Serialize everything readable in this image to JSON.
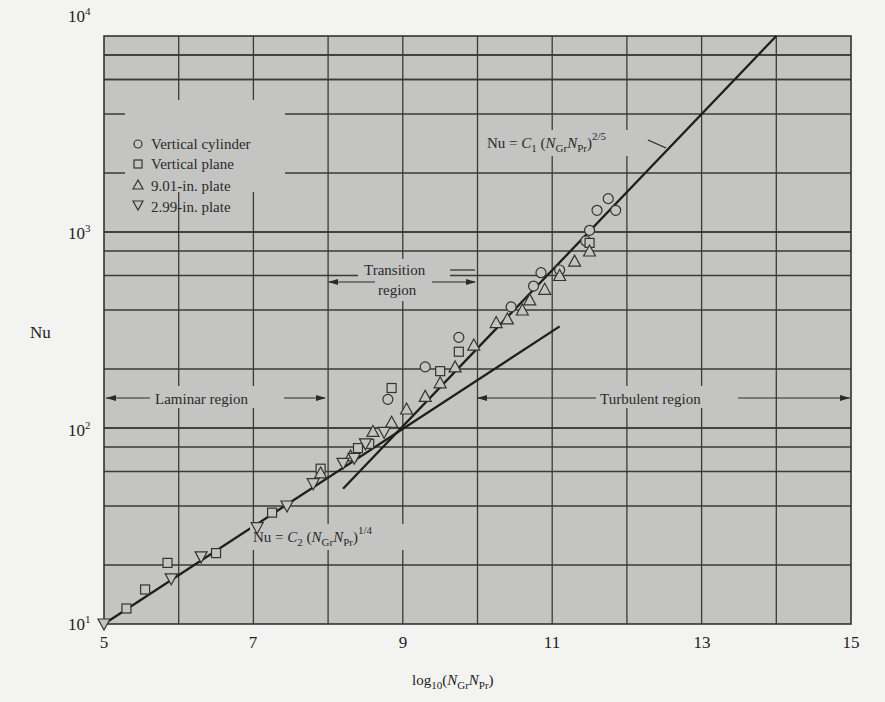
{
  "chart_data": {
    "type": "scatter",
    "title": "",
    "xlabel": "log10(N_Gr N_Pr)",
    "ylabel": "Nu",
    "xlim": [
      5,
      15
    ],
    "ylim": [
      10,
      10000
    ],
    "yscale": "log",
    "grid": true,
    "x_ticks": [
      "5",
      "7",
      "9",
      "11",
      "13",
      "15"
    ],
    "y_ticks": [
      "10^1",
      "10^2",
      "10^3",
      "10^4"
    ],
    "legend_position": "upper-left",
    "series": [
      {
        "name": "Vertical cylinder",
        "marker": "circle",
        "points": [
          [
            8.8,
            140
          ],
          [
            9.3,
            205
          ],
          [
            9.75,
            290
          ],
          [
            10.45,
            415
          ],
          [
            10.75,
            530
          ],
          [
            10.85,
            620
          ],
          [
            11.1,
            640
          ],
          [
            11.45,
            900
          ],
          [
            11.5,
            1020
          ],
          [
            11.6,
            1290
          ],
          [
            11.75,
            1480
          ],
          [
            11.85,
            1290
          ]
        ]
      },
      {
        "name": "Vertical plane",
        "marker": "square",
        "points": [
          [
            5.3,
            12
          ],
          [
            5.55,
            15
          ],
          [
            5.85,
            20.5
          ],
          [
            6.5,
            23
          ],
          [
            7.25,
            37
          ],
          [
            7.9,
            62
          ],
          [
            8.4,
            79
          ],
          [
            8.55,
            83
          ],
          [
            8.85,
            160
          ],
          [
            9.5,
            195
          ],
          [
            9.75,
            245
          ],
          [
            11.5,
            880
          ]
        ]
      },
      {
        "name": "9.01-in. plate",
        "marker": "triangle-up",
        "points": [
          [
            7.9,
            59
          ],
          [
            8.3,
            72
          ],
          [
            8.6,
            96
          ],
          [
            8.85,
            107
          ],
          [
            9.05,
            125
          ],
          [
            9.3,
            145
          ],
          [
            9.5,
            170
          ],
          [
            9.7,
            205
          ],
          [
            9.95,
            265
          ],
          [
            10.25,
            345
          ],
          [
            10.4,
            360
          ],
          [
            10.6,
            400
          ],
          [
            10.7,
            450
          ],
          [
            10.9,
            510
          ],
          [
            11.1,
            600
          ],
          [
            11.3,
            710
          ],
          [
            11.5,
            800
          ]
        ]
      },
      {
        "name": "2.99-in. plate",
        "marker": "triangle-down",
        "points": [
          [
            5.0,
            10
          ],
          [
            5.9,
            17
          ],
          [
            6.3,
            22
          ],
          [
            7.05,
            31
          ],
          [
            7.45,
            40
          ],
          [
            7.8,
            52
          ],
          [
            8.2,
            66
          ],
          [
            8.35,
            70
          ],
          [
            8.5,
            83
          ],
          [
            8.75,
            95
          ]
        ]
      }
    ],
    "lines": [
      {
        "name": "laminar-fit",
        "label": "Nu = C2 (N_Gr N_Pr)^1/4",
        "x": [
          5,
          11.1
        ],
        "y": [
          10,
          330
        ]
      },
      {
        "name": "turbulent-fit",
        "label": "Nu = C1 (N_Gr N_Pr)^2/5",
        "x": [
          8.2,
          14
        ],
        "y": [
          49,
          10000
        ]
      }
    ],
    "annotations": [
      {
        "text": "Laminar region",
        "x_range": [
          5,
          9
        ]
      },
      {
        "text": "Transition region",
        "x_range": [
          8,
          10
        ]
      },
      {
        "text": "Turbulent region",
        "x_range": [
          10,
          15
        ]
      }
    ]
  },
  "labels": {
    "ylabel": "Nu",
    "xlabel_main": "log",
    "xlabel_sub": "10",
    "xlabel_rest_open": "(",
    "xlabel_N": "N",
    "xlabel_Gr": "Gr",
    "xlabel_Pr": "Pr",
    "xlabel_close": ")",
    "yticks": [
      {
        "base": "10",
        "exp": "4"
      },
      {
        "base": "10",
        "exp": "3"
      },
      {
        "base": "10",
        "exp": "2"
      },
      {
        "base": "10",
        "exp": "1"
      }
    ],
    "xticks": [
      "5",
      "7",
      "9",
      "11",
      "13",
      "15"
    ],
    "legend": [
      "Vertical cylinder",
      "Vertical plane",
      "9.01-in. plate",
      "2.99-in. plate"
    ],
    "laminar": "Laminar region",
    "transition_1": "Transition",
    "transition_2": "region",
    "turbulent": "Turbulent region",
    "eq1": {
      "lhs": "Nu = ",
      "C": "C",
      "Csub": "1",
      "open": " (",
      "N1": "N",
      "Gr": "Gr",
      "N2": "N",
      "Pr": "Pr",
      "close": ")",
      "exp": "2/5"
    },
    "eq2": {
      "lhs": "Nu = ",
      "C": "C",
      "Csub": "2",
      "open": " (",
      "N1": "N",
      "Gr": "Gr",
      "N2": "N",
      "Pr": "Pr",
      "close": ")",
      "exp": "1/4"
    }
  },
  "style": {
    "plot_bg": "#c4c4c2",
    "grid": "#3a3a3a",
    "ink": "#222222"
  }
}
